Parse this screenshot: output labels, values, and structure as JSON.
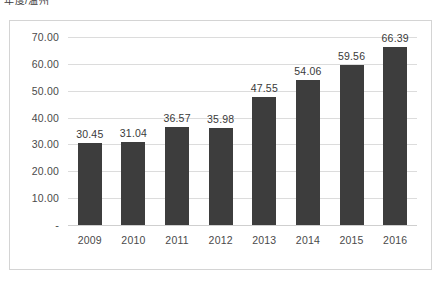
{
  "chart_title": "年度/温州",
  "colors": {
    "bar": "#3d3d3d",
    "gridline": "#dcdcdc",
    "frame_border": "#d4d4d4",
    "plot_background": "#ffffff",
    "tick_label": "#4a4a4a",
    "value_label": "#3a3a3a"
  },
  "chart_data": {
    "type": "bar",
    "title": "年度/温州",
    "xlabel": "",
    "ylabel": "",
    "categories": [
      "2009",
      "2010",
      "2011",
      "2012",
      "2013",
      "2014",
      "2015",
      "2016"
    ],
    "values": [
      30.45,
      31.04,
      36.57,
      35.98,
      47.55,
      54.06,
      59.56,
      66.39
    ],
    "value_labels": [
      "30.45",
      "31.04",
      "36.57",
      "35.98",
      "47.55",
      "54.06",
      "59.56",
      "66.39"
    ],
    "ylim": [
      0,
      70
    ],
    "ytick_values": [
      70,
      60,
      50,
      40,
      30,
      20,
      10,
      0
    ],
    "ytick_labels": [
      "70.00",
      "60.00",
      "50.00",
      "40.00",
      "30.00",
      "20.00",
      "10.00",
      "-"
    ],
    "grid": true,
    "legend": false,
    "series": [
      {
        "name": "",
        "values": [
          30.45,
          31.04,
          36.57,
          35.98,
          47.55,
          54.06,
          59.56,
          66.39
        ]
      }
    ]
  }
}
